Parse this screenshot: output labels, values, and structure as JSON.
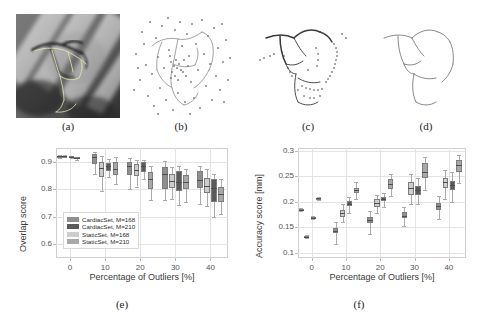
{
  "figure": {
    "panels": [
      {
        "id": "a",
        "label": "(a)",
        "caption_kind": "angiography-xray-with-vessel-overlay"
      },
      {
        "id": "b",
        "label": "(b)",
        "caption_kind": "vessel-tree-with-outlier-point-cloud"
      },
      {
        "id": "c",
        "label": "(c)",
        "caption_kind": "vessel-tree-with-sparse-outliers"
      },
      {
        "id": "d",
        "label": "(d)",
        "caption_kind": "clean-vessel-centerline"
      },
      {
        "id": "e",
        "label": "(e)",
        "caption_kind": "overlap-score-boxplot"
      },
      {
        "id": "f",
        "label": "(f)",
        "caption_kind": "accuracy-score-boxplot"
      }
    ]
  },
  "legend": {
    "items": [
      {
        "label": "CardiacSet, M=168",
        "color": "#8f8f8f"
      },
      {
        "label": "CardiacSet, M=210",
        "color": "#5a5a5a"
      },
      {
        "label": "StaticSet, M=168",
        "color": "#cdcdcd"
      },
      {
        "label": "StaticSet, M=210",
        "color": "#a8a8a8"
      }
    ]
  },
  "chart_data": [
    {
      "type": "boxplot",
      "panel": "e",
      "title": "",
      "xlabel": "Percentage of Outliers [%]",
      "ylabel": "Overlap score",
      "xlim": [
        -4,
        45
      ],
      "ylim": [
        0.55,
        0.95
      ],
      "xticks": [
        0,
        10,
        20,
        30,
        40
      ],
      "xticklabels": [
        "0",
        "10",
        "20",
        "30",
        "40"
      ],
      "yticks": [
        0.6,
        0.7,
        0.8,
        0.9
      ],
      "yticklabels": [
        "0.6",
        "0.7",
        "0.8",
        "0.9"
      ],
      "grid": true,
      "legend_position": "lower-left",
      "groups": [
        0,
        10,
        20,
        30,
        40
      ],
      "series": [
        {
          "name": "CardiacSet, M=168",
          "color": "#8f8f8f",
          "boxes": [
            {
              "x": -1.5,
              "min": 0.916,
              "q1": 0.92,
              "med": 0.921,
              "q3": 0.922,
              "max": 0.924
            },
            {
              "x": 7.0,
              "min": 0.855,
              "q1": 0.893,
              "med": 0.917,
              "q3": 0.929,
              "max": 0.936
            },
            {
              "x": 17.0,
              "min": 0.8,
              "q1": 0.853,
              "med": 0.884,
              "q3": 0.898,
              "max": 0.915
            },
            {
              "x": 27.0,
              "min": 0.76,
              "q1": 0.8,
              "med": 0.856,
              "q3": 0.88,
              "max": 0.903
            },
            {
              "x": 37.0,
              "min": 0.745,
              "q1": 0.805,
              "med": 0.835,
              "q3": 0.866,
              "max": 0.885
            }
          ]
        },
        {
          "name": "CardiacSet, M=210",
          "color": "#5a5a5a",
          "boxes": [
            {
              "x": 0.5,
              "min": 0.912,
              "q1": 0.916,
              "med": 0.918,
              "q3": 0.92,
              "max": 0.922
            },
            {
              "x": 11.0,
              "min": 0.846,
              "q1": 0.866,
              "med": 0.884,
              "q3": 0.897,
              "max": 0.911
            },
            {
              "x": 21.0,
              "min": 0.838,
              "q1": 0.862,
              "med": 0.884,
              "q3": 0.898,
              "max": 0.908
            },
            {
              "x": 31.0,
              "min": 0.742,
              "q1": 0.793,
              "med": 0.826,
              "q3": 0.866,
              "max": 0.886
            },
            {
              "x": 41.0,
              "min": 0.7,
              "q1": 0.752,
              "med": 0.806,
              "q3": 0.838,
              "max": 0.856
            }
          ]
        },
        {
          "name": "StaticSet, M=168",
          "color": "#cdcdcd",
          "boxes": [
            {
              "x": -3.0,
              "min": 0.915,
              "q1": 0.919,
              "med": 0.92,
              "q3": 0.921,
              "max": 0.923
            },
            {
              "x": 9.0,
              "min": 0.793,
              "q1": 0.844,
              "med": 0.876,
              "q3": 0.898,
              "max": 0.921
            },
            {
              "x": 19.0,
              "min": 0.81,
              "q1": 0.849,
              "med": 0.87,
              "q3": 0.892,
              "max": 0.907
            },
            {
              "x": 29.0,
              "min": 0.764,
              "q1": 0.803,
              "med": 0.831,
              "q3": 0.856,
              "max": 0.882
            },
            {
              "x": 39.0,
              "min": 0.738,
              "q1": 0.786,
              "med": 0.813,
              "q3": 0.842,
              "max": 0.872
            }
          ]
        },
        {
          "name": "StaticSet, M=210",
          "color": "#a8a8a8",
          "boxes": [
            {
              "x": 2.0,
              "min": 0.908,
              "q1": 0.913,
              "med": 0.915,
              "q3": 0.917,
              "max": 0.919
            },
            {
              "x": 13.0,
              "min": 0.818,
              "q1": 0.853,
              "med": 0.874,
              "q3": 0.899,
              "max": 0.916
            },
            {
              "x": 23.0,
              "min": 0.762,
              "q1": 0.8,
              "med": 0.836,
              "q3": 0.864,
              "max": 0.886
            },
            {
              "x": 33.0,
              "min": 0.752,
              "q1": 0.8,
              "med": 0.828,
              "q3": 0.852,
              "max": 0.875
            },
            {
              "x": 43.0,
              "min": 0.71,
              "q1": 0.752,
              "med": 0.782,
              "q3": 0.808,
              "max": 0.836
            }
          ]
        }
      ]
    },
    {
      "type": "boxplot",
      "panel": "f",
      "title": "",
      "xlabel": "Percentage of Outliers [%]",
      "ylabel": "Accuracy score [mm]",
      "xlim": [
        -4,
        45
      ],
      "ylim": [
        0.09,
        0.305
      ],
      "xticks": [
        0,
        10,
        20,
        30,
        40
      ],
      "xticklabels": [
        "0",
        "10",
        "20",
        "30",
        "40"
      ],
      "yticks": [
        0.1,
        0.15,
        0.2,
        0.25,
        0.3
      ],
      "yticklabels": [
        "0.1",
        "0.15",
        "0.2",
        "0.25",
        "0.3"
      ],
      "grid": true,
      "legend_position": "none",
      "groups": [
        0,
        10,
        20,
        30,
        40
      ],
      "series": [
        {
          "name": "CardiacSet, M=168",
          "color": "#8f8f8f",
          "boxes": [
            {
              "x": -1.5,
              "min": 0.129,
              "q1": 0.131,
              "med": 0.132,
              "q3": 0.133,
              "max": 0.135
            },
            {
              "x": 7.0,
              "min": 0.118,
              "q1": 0.138,
              "med": 0.143,
              "q3": 0.149,
              "max": 0.16
            },
            {
              "x": 17.0,
              "min": 0.137,
              "q1": 0.158,
              "med": 0.164,
              "q3": 0.17,
              "max": 0.182
            },
            {
              "x": 27.0,
              "min": 0.152,
              "q1": 0.168,
              "med": 0.173,
              "q3": 0.179,
              "max": 0.19
            },
            {
              "x": 37.0,
              "min": 0.166,
              "q1": 0.184,
              "med": 0.191,
              "q3": 0.198,
              "max": 0.212
            }
          ]
        },
        {
          "name": "CardiacSet, M=210",
          "color": "#5a5a5a",
          "boxes": [
            {
              "x": 0.5,
              "min": 0.166,
              "q1": 0.168,
              "med": 0.169,
              "q3": 0.17,
              "max": 0.172
            },
            {
              "x": 11.0,
              "min": 0.178,
              "q1": 0.191,
              "med": 0.196,
              "q3": 0.201,
              "max": 0.21
            },
            {
              "x": 21.0,
              "min": 0.19,
              "q1": 0.201,
              "med": 0.205,
              "q3": 0.209,
              "max": 0.218
            },
            {
              "x": 31.0,
              "min": 0.196,
              "q1": 0.214,
              "med": 0.223,
              "q3": 0.231,
              "max": 0.246
            },
            {
              "x": 41.0,
              "min": 0.2,
              "q1": 0.223,
              "med": 0.232,
              "q3": 0.241,
              "max": 0.258
            }
          ]
        },
        {
          "name": "StaticSet, M=168",
          "color": "#cdcdcd",
          "boxes": [
            {
              "x": -3.0,
              "min": 0.181,
              "q1": 0.183,
              "med": 0.184,
              "q3": 0.185,
              "max": 0.187
            },
            {
              "x": 9.0,
              "min": 0.16,
              "q1": 0.171,
              "med": 0.177,
              "q3": 0.183,
              "max": 0.196
            },
            {
              "x": 19.0,
              "min": 0.178,
              "q1": 0.19,
              "med": 0.197,
              "q3": 0.205,
              "max": 0.214
            },
            {
              "x": 29.0,
              "min": 0.196,
              "q1": 0.213,
              "med": 0.226,
              "q3": 0.239,
              "max": 0.254
            },
            {
              "x": 39.0,
              "min": 0.205,
              "q1": 0.227,
              "med": 0.238,
              "q3": 0.247,
              "max": 0.262
            }
          ]
        },
        {
          "name": "StaticSet, M=210",
          "color": "#a8a8a8",
          "boxes": [
            {
              "x": 2.0,
              "min": 0.204,
              "q1": 0.206,
              "med": 0.207,
              "q3": 0.208,
              "max": 0.21
            },
            {
              "x": 13.0,
              "min": 0.206,
              "q1": 0.217,
              "med": 0.222,
              "q3": 0.227,
              "max": 0.238
            },
            {
              "x": 23.0,
              "min": 0.212,
              "q1": 0.224,
              "med": 0.234,
              "q3": 0.245,
              "max": 0.255
            },
            {
              "x": 33.0,
              "min": 0.222,
              "q1": 0.246,
              "med": 0.259,
              "q3": 0.275,
              "max": 0.287
            },
            {
              "x": 43.0,
              "min": 0.236,
              "q1": 0.258,
              "med": 0.271,
              "q3": 0.281,
              "max": 0.292
            }
          ]
        }
      ]
    }
  ]
}
